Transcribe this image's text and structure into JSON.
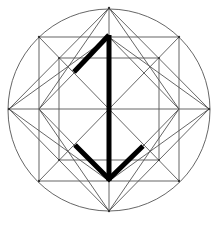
{
  "diagram": {
    "colors": {
      "background": "#ffffff",
      "guide_lines": "#555555",
      "rune": "#000000"
    },
    "circle": {
      "cx": 109,
      "cy": 110,
      "r": 101
    },
    "outer_square": {
      "x1": 39,
      "y1": 37,
      "x2": 179,
      "y2": 181
    },
    "inner_square": {
      "x1": 59,
      "y1": 58,
      "x2": 159,
      "y2": 160
    },
    "outer_diamond": [
      [
        109,
        8
      ],
      [
        209,
        109
      ],
      [
        109,
        211
      ],
      [
        9,
        109
      ]
    ],
    "inner_diamond": [
      [
        109,
        37
      ],
      [
        179,
        109
      ],
      [
        109,
        181
      ],
      [
        39,
        109
      ]
    ],
    "axes": {
      "horizontal_y": 109,
      "vertical_x": 109
    },
    "rune_strokes": [
      {
        "name": "stave",
        "points": [
          [
            109,
            35
          ],
          [
            109,
            181
          ]
        ]
      },
      {
        "name": "upper-branch",
        "points": [
          [
            109,
            35
          ],
          [
            74,
            72
          ]
        ]
      },
      {
        "name": "lower-chevron",
        "points": [
          [
            75,
            145
          ],
          [
            109,
            179
          ],
          [
            143,
            146
          ]
        ]
      }
    ]
  }
}
